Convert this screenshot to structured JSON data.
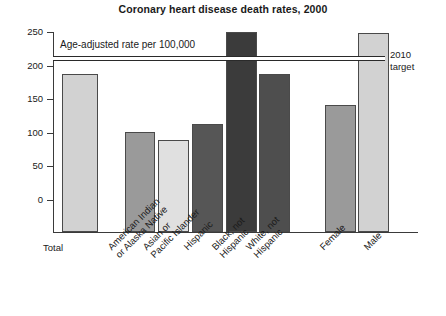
{
  "chart_data": {
    "type": "bar",
    "title": "Coronary heart disease death rates, 2000",
    "xlabel": "",
    "ylabel": "",
    "annotation": "Age-adjusted rate per 100,000",
    "ylim": [
      0,
      250
    ],
    "yticks": [
      0,
      50,
      100,
      150,
      200,
      250
    ],
    "ytick_labels": [
      "0",
      "50",
      "100",
      "150",
      "200",
      "250"
    ],
    "grid": false,
    "legend": "none",
    "categories": [
      "Total",
      "American Indian\nor Alaska Native",
      "Asian or\nPacific Islander",
      "Hispanic",
      "Black, not\nHispanic",
      "White, not\nHispanic",
      "Female",
      "Male"
    ],
    "values": [
      187,
      101,
      90,
      113,
      250,
      187,
      141,
      248
    ],
    "bar_colors": [
      "#d2d2d2",
      "#9a9a9a",
      "#e0e0e0",
      "#565656",
      "#3b3b3b",
      "#4e4e4e",
      "#9a9a9a",
      "#d2d2d2"
    ],
    "reference_line": {
      "label": "2010\ntarget",
      "value": 212
    }
  },
  "axis": {
    "tick_250": "250",
    "tick_200": "200",
    "tick_150": "150",
    "tick_100": "100",
    "tick_50": "50",
    "tick_0": "0"
  },
  "labels": {
    "cat0": "Total",
    "cat1": "American Indian\nor Alaska Native",
    "cat2": "Asian or\nPacific Islander",
    "cat3": "Hispanic",
    "cat4": "Black, not\nHispanic",
    "cat5": "White, not\nHispanic",
    "cat6": "Female",
    "cat7": "Male"
  },
  "target": {
    "text": "2010\ntarget"
  },
  "note": {
    "text": "Age-adjusted rate per 100,000"
  }
}
